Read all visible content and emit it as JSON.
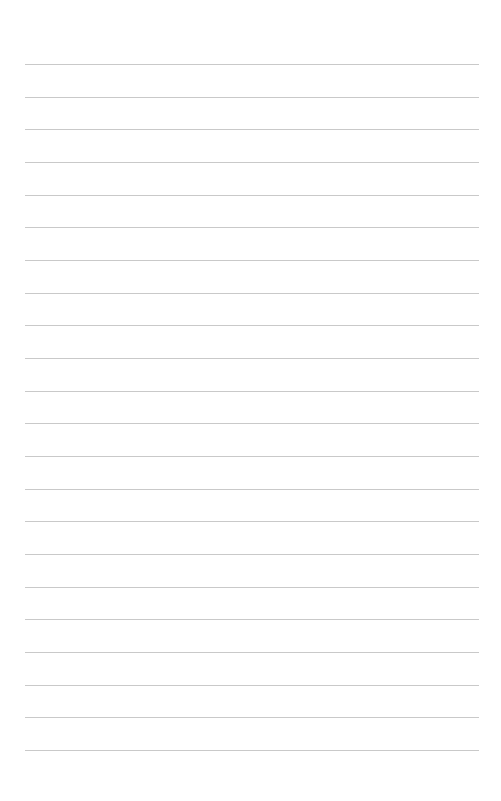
{
  "document": {
    "type": "lined-paper",
    "title": "",
    "subtitle": "",
    "body_text": "",
    "is_blank": true,
    "content_note": ""
  },
  "page": {
    "width": 501,
    "height": 801,
    "background_color": "#ffffff",
    "orientation": "portrait"
  },
  "ruling": {
    "line_color": "#c9c9c9",
    "line_thickness": 1,
    "line_count": 22,
    "line_left": 25,
    "line_right": 479,
    "line_length": 454,
    "first_line_y": 64,
    "line_spacing": 32.7,
    "last_line_y": 762,
    "top_margin": 64,
    "bottom_margin": 39,
    "left_margin": 25,
    "right_margin": 22,
    "has_margin_rule": false,
    "has_punch_holes": false,
    "has_header": false,
    "has_footer": false
  },
  "lines": [
    {
      "index": 1,
      "y": 64,
      "text": ""
    },
    {
      "index": 2,
      "y": 97,
      "text": ""
    },
    {
      "index": 3,
      "y": 129,
      "text": ""
    },
    {
      "index": 4,
      "y": 162,
      "text": ""
    },
    {
      "index": 5,
      "y": 195,
      "text": ""
    },
    {
      "index": 6,
      "y": 227,
      "text": ""
    },
    {
      "index": 7,
      "y": 260,
      "text": ""
    },
    {
      "index": 8,
      "y": 293,
      "text": ""
    },
    {
      "index": 9,
      "y": 325,
      "text": ""
    },
    {
      "index": 10,
      "y": 358,
      "text": ""
    },
    {
      "index": 11,
      "y": 391,
      "text": ""
    },
    {
      "index": 12,
      "y": 423,
      "text": ""
    },
    {
      "index": 13,
      "y": 456,
      "text": ""
    },
    {
      "index": 14,
      "y": 489,
      "text": ""
    },
    {
      "index": 15,
      "y": 521,
      "text": ""
    },
    {
      "index": 16,
      "y": 554,
      "text": ""
    },
    {
      "index": 17,
      "y": 587,
      "text": ""
    },
    {
      "index": 18,
      "y": 619,
      "text": ""
    },
    {
      "index": 19,
      "y": 652,
      "text": ""
    },
    {
      "index": 20,
      "y": 685,
      "text": ""
    },
    {
      "index": 21,
      "y": 717,
      "text": ""
    },
    {
      "index": 22,
      "y": 750,
      "text": ""
    }
  ]
}
